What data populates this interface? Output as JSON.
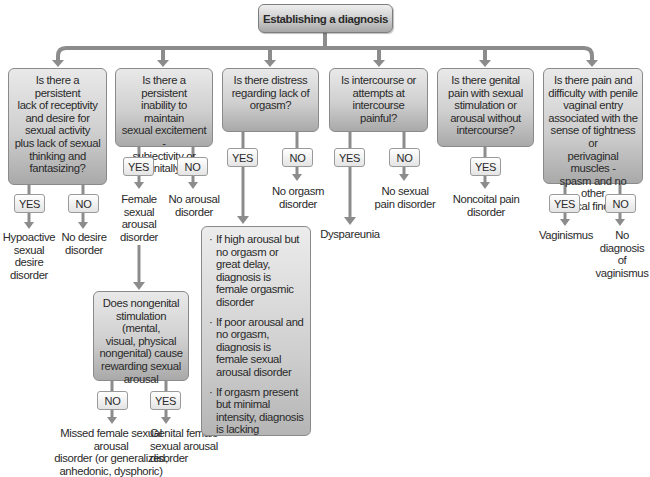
{
  "title": "Establishing a diagnosis",
  "colors": {
    "connector": "#8c8c8c",
    "box_top": "#e9e9e9",
    "box_bottom": "#a9a9a9",
    "pill": "#f2f2f2"
  },
  "questions": [
    {
      "id": "q1",
      "text": "Is there a persistent lack of receptivity and desire for sexual activity plus lack of sexual thinking and fantasizing?"
    },
    {
      "id": "q2",
      "text": "Is there a persistent inability to maintain sexual excitement - subjectivity or genitally?"
    },
    {
      "id": "q3",
      "text": "Is there distress regarding lack of orgasm?"
    },
    {
      "id": "q4",
      "text": "Is intercourse or attempts at intercourse painful?"
    },
    {
      "id": "q5",
      "text": "Is there genital pain with sexual stimulation or arousal without intercourse?"
    },
    {
      "id": "q6",
      "text": "Is there pain and difficulty with penile vaginal entry associated with the sense of tightness or perivaginal muscles - spasm and no other physical findings?"
    }
  ],
  "q1_lines": [
    "Is there a persistent",
    "lack of receptivity",
    "and desire for",
    "sexual activity",
    "plus lack of sexual",
    "thinking and",
    "fantasizing?"
  ],
  "q2_lines": [
    "Is there a persistent",
    "inability to maintain",
    "sexual excitement -",
    "subjectivity or",
    "genitally?"
  ],
  "q3_lines": [
    "Is there distress",
    "regarding lack of",
    "orgasm?"
  ],
  "q4_lines": [
    "Is intercourse or",
    "attempts at",
    "intercourse",
    "painful?"
  ],
  "q5_lines": [
    "Is there genital",
    "pain with sexual",
    "stimulation or",
    "arousal without",
    "intercourse?"
  ],
  "q6_lines": [
    "Is there pain and",
    "difficulty with penile",
    "vaginal entry",
    "associated with the",
    "sense of tightness or",
    "perivaginal muscles -",
    "spasm and no other",
    "physical findings?"
  ],
  "labels": {
    "yes": "YES",
    "no": "NO"
  },
  "outcomes": {
    "q1_yes": [
      "Hypoactive",
      "sexual",
      "desire",
      "disorder"
    ],
    "q1_no": [
      "No desire",
      "disorder"
    ],
    "q2_yes": [
      "Female",
      "sexual",
      "arousal",
      "disorder"
    ],
    "q2_no": [
      "No arousal",
      "disorder"
    ],
    "q3_no": [
      "No orgasm",
      "disorder"
    ],
    "q4_yes": [
      "Dyspareunia"
    ],
    "q4_no": [
      "No sexual",
      "pain disorder"
    ],
    "q5_yes": [
      "Noncoital pain",
      "disorder"
    ],
    "q6_yes": [
      "Vaginismus"
    ],
    "q6_no": [
      "No diagnosis",
      "of vaginismus"
    ],
    "q7_no": [
      "Missed female sexual arousal",
      "disorder (or generalized,",
      "anhedonic, dysphoric)"
    ],
    "q7_yes": [
      "Genital female",
      "sexual arousal",
      "disorder"
    ]
  },
  "q7_lines": [
    "Does nongenital",
    "stimulation (mental,",
    "visual, physical",
    "nongenital) cause",
    "rewarding sexual",
    "arousal"
  ],
  "orgasm_notes": [
    "If high arousal but no orgasm or great delay, diagnosis is female orgasmic disorder",
    "If poor arousal and no orgasm, diagnosis is female sexual arousal disorder",
    "If orgasm present but minimal intensity, diagnosis is lacking"
  ]
}
